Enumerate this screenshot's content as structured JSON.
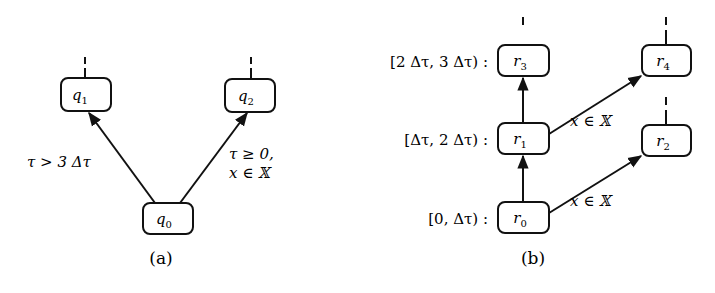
{
  "panel_a": {
    "caption": "(a)",
    "nodes": [
      {
        "id": "q0",
        "base": "q",
        "sub": "0"
      },
      {
        "id": "q1",
        "base": "q",
        "sub": "1"
      },
      {
        "id": "q2",
        "base": "q",
        "sub": "2"
      }
    ],
    "edges": [
      {
        "from": "q0",
        "to": "q1",
        "label": "τ > 3 Δτ"
      },
      {
        "from": "q0",
        "to": "q2",
        "label_line1": "τ ≥ 0,",
        "label_line2": "x ∈ 𝕏"
      }
    ]
  },
  "panel_b": {
    "caption": "(b)",
    "nodes": [
      {
        "id": "r0",
        "base": "r",
        "sub": "0"
      },
      {
        "id": "r1",
        "base": "r",
        "sub": "1"
      },
      {
        "id": "r2",
        "base": "r",
        "sub": "2"
      },
      {
        "id": "r3",
        "base": "r",
        "sub": "3"
      },
      {
        "id": "r4",
        "base": "r",
        "sub": "4"
      }
    ],
    "intervals": [
      {
        "node": "r3",
        "label": "[2 Δτ, 3 Δτ) :"
      },
      {
        "node": "r1",
        "label": "[Δτ, 2 Δτ) :"
      },
      {
        "node": "r0",
        "label": "[0, Δτ) :"
      }
    ],
    "edges": [
      {
        "from": "r0",
        "to": "r1",
        "label": ""
      },
      {
        "from": "r1",
        "to": "r3",
        "label": ""
      },
      {
        "from": "r1",
        "to": "r4",
        "label": "x ∈ 𝕏"
      },
      {
        "from": "r0",
        "to": "r2",
        "label": "x ∈ 𝕏"
      }
    ]
  }
}
